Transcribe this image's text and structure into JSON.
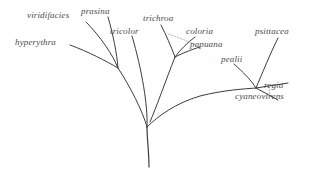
{
  "figure": {
    "name": "phylogenetic-tree",
    "type": "unrooted-phylogram",
    "background_color": "#ffffff",
    "branch_color": "#3c3c3c",
    "label_color": "#4a4a4a",
    "label_style": "italic"
  },
  "taxa": [
    {
      "id": "viridifacies",
      "label": "viridifacies",
      "x": 27,
      "y": 10
    },
    {
      "id": "prasina",
      "label": "prasina",
      "x": 81,
      "y": 6
    },
    {
      "id": "trichroa",
      "label": "trichroa",
      "x": 143,
      "y": 13
    },
    {
      "id": "coloria",
      "label": "coloria",
      "x": 186,
      "y": 26
    },
    {
      "id": "psittacea",
      "label": "psittacea",
      "x": 255,
      "y": 26
    },
    {
      "id": "hyperythra",
      "label": "hyperythra",
      "x": 15,
      "y": 37
    },
    {
      "id": "tricolor",
      "label": "tricolor",
      "x": 110,
      "y": 26
    },
    {
      "id": "papuana",
      "label": "papuana",
      "x": 190,
      "y": 39
    },
    {
      "id": "pealii",
      "label": "pealii",
      "x": 221,
      "y": 54
    },
    {
      "id": "regia",
      "label": "regia",
      "x": 264,
      "y": 80
    },
    {
      "id": "cyaneovirens",
      "label": "cyaneovirens",
      "x": 235,
      "y": 91
    }
  ],
  "nodes": {
    "root": {
      "x": 147,
      "y": 127
    },
    "stem_base": {
      "x": 149,
      "y": 167
    },
    "left_node": {
      "x": 118,
      "y": 68
    },
    "mid_node": {
      "x": 175,
      "y": 57
    },
    "right_node": {
      "x": 256,
      "y": 88
    },
    "regia_node": {
      "x": 272,
      "y": 83
    }
  },
  "branches": [
    {
      "name": "stem",
      "from": "root",
      "to": "stem_base"
    },
    {
      "name": "root-to-left",
      "from": "root",
      "to": "left_node"
    },
    {
      "name": "root-to-tricolor",
      "from": "root",
      "to": "tricolor"
    },
    {
      "name": "root-to-right",
      "from": "root",
      "to": "right_node"
    },
    {
      "name": "left-to-hyperythra",
      "from": "left_node",
      "to": "hyperythra"
    },
    {
      "name": "left-to-viridifacies",
      "from": "left_node",
      "to": "viridifacies"
    },
    {
      "name": "left-to-prasina",
      "from": "left_node",
      "to": "prasina"
    },
    {
      "name": "mid-to-trichroa",
      "from": "mid_node",
      "to": "trichroa"
    },
    {
      "name": "mid-to-coloria",
      "from": "mid_node",
      "to": "coloria"
    },
    {
      "name": "mid-to-papuana",
      "from": "mid_node",
      "to": "papuana"
    },
    {
      "name": "right-to-psittacea",
      "from": "right_node",
      "to": "psittacea"
    },
    {
      "name": "right-to-pealii",
      "from": "right_node",
      "to": "pealii"
    },
    {
      "name": "right-to-regia",
      "from": "right_node",
      "to": "regia_node"
    },
    {
      "name": "right-to-cyaneovirens",
      "from": "right_node",
      "to": "cyaneovirens"
    }
  ]
}
